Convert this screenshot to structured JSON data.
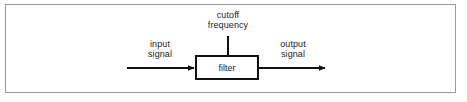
{
  "figure": {
    "type": "block-diagram",
    "frame_color": "#9a9a9a",
    "background_color": "#ffffff",
    "line_color": "#111111",
    "text_color": "#1c1c1c"
  },
  "block": {
    "label": "filter"
  },
  "labels": {
    "cutoff_frequency": "cutoff\nfrequency",
    "cutoff_frequency_line1": "cutoff",
    "cutoff_frequency_line2": "frequency",
    "input_signal_line1": "input",
    "input_signal_line2": "signal",
    "output_signal_line1": "output",
    "output_signal_line2": "signal"
  },
  "connections": [
    {
      "name": "input-arrow",
      "from": "input signal",
      "to": "filter",
      "direction": "right",
      "arrowhead": true
    },
    {
      "name": "output-arrow",
      "from": "filter",
      "to": "output signal",
      "direction": "right",
      "arrowhead": true
    },
    {
      "name": "cutoff-frequency-lead",
      "from": "cutoff frequency",
      "to": "filter",
      "direction": "down",
      "arrowhead": false
    }
  ]
}
